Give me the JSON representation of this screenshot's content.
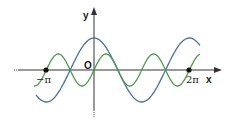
{
  "diagram": {
    "type": "function-graph",
    "axes": {
      "x_label": "x",
      "y_label": "y",
      "origin_label": "O",
      "tick_labels": [
        "−π",
        "2π"
      ],
      "tick_values": [
        -3.14159,
        6.28318
      ]
    },
    "curves": [
      {
        "name": "blue-curve",
        "function": "y = cos x",
        "color": "#4a6fa0",
        "amplitude": 1,
        "period": "2π"
      },
      {
        "name": "green-curve",
        "function": "y = ½ sin 2x",
        "color": "#4e9a4a",
        "amplitude": 0.5,
        "period": "π"
      }
    ],
    "marked_points": [
      {
        "label": "−π",
        "x": -3.14159,
        "y": 0
      },
      {
        "label": "2π",
        "x": 6.28318,
        "y": 0
      }
    ],
    "colors": {
      "axis": "#333333",
      "blue": "#4a6fa0",
      "green": "#4e9a4a",
      "point": "#111111"
    }
  }
}
